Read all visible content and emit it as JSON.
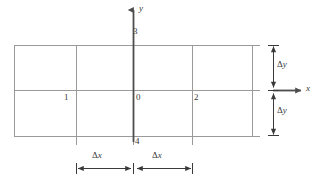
{
  "figure": {
    "type": "diagram",
    "background_color": "#ffffff",
    "grid_color": "#9a9a9a",
    "axis_color": "#4d4d4d",
    "dimension_color": "#3a3a3a",
    "text_color": "#3a3a3a"
  },
  "axes": {
    "x": {
      "label": "x",
      "arrow_from_x": 273,
      "arrow_to_x": 303,
      "y": 90,
      "label_x": 307,
      "label_y": 86
    },
    "y": {
      "label": "y",
      "arrow_from_y": 142,
      "arrow_to_y": 8,
      "x": 133,
      "label_x": 140,
      "label_y": 6
    }
  },
  "grid": {
    "vertical_lines_x": [
      14,
      76,
      133,
      192,
      252
    ],
    "horizontal_lines_y": [
      45,
      90,
      136
    ],
    "left": 14,
    "right": 252,
    "top": 45,
    "bottom": 136,
    "horizontal_extension_right": 260
  },
  "nodes": [
    {
      "label": "0",
      "x": 136,
      "y": 96,
      "grid_x": 133,
      "grid_y": 90
    },
    {
      "label": "1",
      "x": 66,
      "y": 96,
      "grid_x": 76,
      "grid_y": 90
    },
    {
      "label": "2",
      "x": 196,
      "y": 96,
      "grid_x": 192,
      "grid_y": 90
    },
    {
      "label": "3",
      "x": 136,
      "y": 29,
      "grid_x": 133,
      "grid_y": 45
    },
    {
      "label": "4",
      "x": 136,
      "y": 138,
      "grid_x": 133,
      "grid_y": 136
    }
  ],
  "dimensions": [
    {
      "name": "delta-x-left",
      "label": "Δx",
      "symbol_delta": "Δ",
      "symbol_var": "x",
      "orientation": "horizontal",
      "from": 76,
      "to": 133,
      "axis_pos": 168,
      "label_x": 96,
      "label_y": 154
    },
    {
      "name": "delta-x-right",
      "label": "Δx",
      "symbol_delta": "Δ",
      "symbol_var": "x",
      "orientation": "horizontal",
      "from": 136,
      "to": 192,
      "axis_pos": 168,
      "label_x": 156,
      "label_y": 154
    },
    {
      "name": "delta-y-upper",
      "label": "Δy",
      "symbol_delta": "Δ",
      "symbol_var": "y",
      "orientation": "vertical",
      "from": 45,
      "to": 88,
      "axis_pos": 273,
      "label_x": 279,
      "label_y": 62
    },
    {
      "name": "delta-y-lower",
      "label": "Δy",
      "symbol_delta": "Δ",
      "symbol_var": "y",
      "orientation": "vertical",
      "from": 93,
      "to": 136,
      "axis_pos": 273,
      "label_x": 279,
      "label_y": 110
    }
  ]
}
